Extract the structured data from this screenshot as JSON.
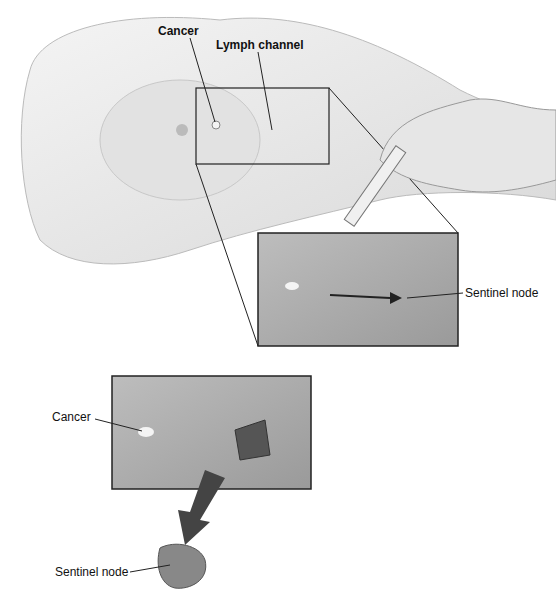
{
  "labels": {
    "top_cancer": "Cancer",
    "lymph_channel": "Lymph channel",
    "sentinel_node_inset": "Sentinel node",
    "bottom_cancer": "Cancer",
    "sentinel_node_removed": "Sentinel node"
  }
}
